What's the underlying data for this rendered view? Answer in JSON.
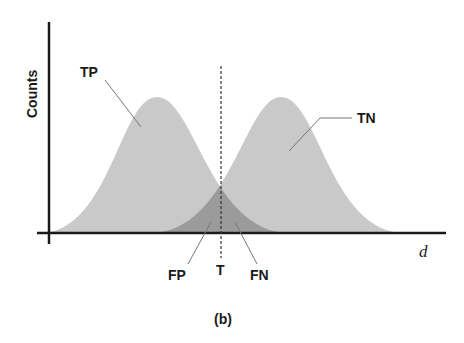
{
  "figure": {
    "caption": "(b)",
    "y_axis_label": "Counts",
    "x_axis_label": "d",
    "threshold_label": "T",
    "labels": {
      "tp": "TP",
      "tn": "TN",
      "fp": "FP",
      "fn": "FN"
    },
    "colors": {
      "curve_fill": "#c8c8c8",
      "overlap_fill": "#9a9a9a",
      "axis": "#1a1a1a",
      "leader": "#777777"
    }
  }
}
